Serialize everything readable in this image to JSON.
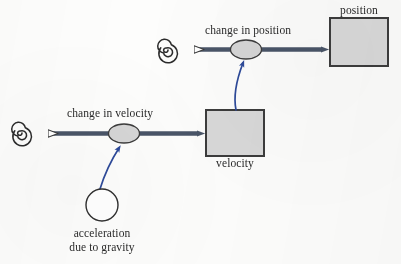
{
  "diagram": {
    "type": "stock-and-flow",
    "title": "",
    "colors": {
      "flow_arrow": "#4a5568",
      "flow_arrow_dark": "#3f4a5a",
      "stock_fill": "#d9d9d9",
      "stock_border": "#3c3c3c",
      "valve_fill": "#d6d6d6",
      "valve_border": "#3c3c3c",
      "converter_fill": "#ffffff",
      "converter_border": "#2f2f2f",
      "influence_arrow": "#2d4a9a",
      "cloud_spiral": "#2b2b2b",
      "text": "#2b2b2b",
      "background": "#fdfdfc"
    },
    "stocks": [
      {
        "id": "position",
        "label": "position",
        "label_position": "above",
        "x": 330,
        "y": 18,
        "width": 58,
        "height": 48
      },
      {
        "id": "velocity",
        "label": "velocity",
        "label_position": "below",
        "x": 206,
        "y": 110,
        "width": 58,
        "height": 46
      }
    ],
    "flows": [
      {
        "id": "change-in-position",
        "label": "change in position",
        "label_x": 255,
        "label_y": 32,
        "valve_cx": 246,
        "valve_cy": 49,
        "source": "cloud-top",
        "target": "position"
      },
      {
        "id": "change-in-velocity",
        "label": "change in velocity",
        "label_x": 116,
        "label_y": 114,
        "valve_cx": 124,
        "valve_cy": 133,
        "source": "cloud-bottom",
        "target": "velocity"
      }
    ],
    "clouds": [
      {
        "id": "cloud-top",
        "cx": 168,
        "cy": 50,
        "r": 10
      },
      {
        "id": "cloud-bottom",
        "cx": 22,
        "cy": 133,
        "r": 10
      }
    ],
    "converters": [
      {
        "id": "acceleration-due-to-gravity",
        "label": "acceleration due to gravity",
        "label_line1": "acceleration",
        "label_line2": "due to gravity",
        "cx": 102,
        "cy": 205,
        "r": 16
      }
    ],
    "influence_links": [
      {
        "id": "gravity-to-change-in-velocity",
        "from": "acceleration-due-to-gravity",
        "to": "change-in-velocity",
        "color": "#2d4a9a"
      },
      {
        "id": "velocity-to-change-in-position",
        "from": "velocity",
        "to": "change-in-position",
        "color": "#2d4a9a"
      }
    ]
  }
}
